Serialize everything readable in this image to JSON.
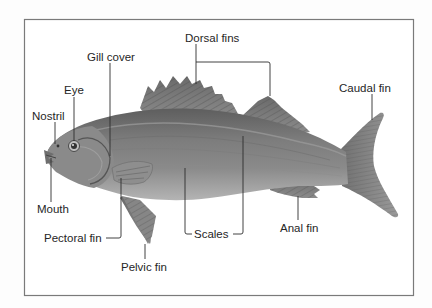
{
  "diagram": {
    "frame_color": "#7a7a7a",
    "fish_body_color": "#7b7b7b",
    "labels": {
      "dorsal_fins": "Dorsal fins",
      "gill_cover": "Gill cover",
      "eye": "Eye",
      "nostril": "Nostril",
      "caudal_fin": "Caudal fin",
      "mouth": "Mouth",
      "pectoral_fin": "Pectoral fin",
      "pelvic_fin": "Pelvic fin",
      "scales": "Scales",
      "anal_fin": "Anal fin"
    }
  }
}
